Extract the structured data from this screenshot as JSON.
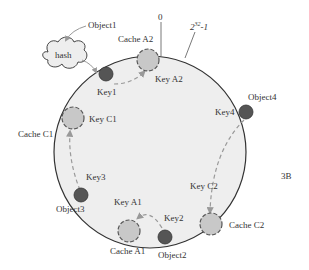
{
  "diagram": {
    "type": "consistent-hashing-ring",
    "figure_label": "3B",
    "colors": {
      "ring_fill": "#eeeeee",
      "ring_stroke": "#333333",
      "cache_fill": "#c8c8c8",
      "cache_stroke": "#555555",
      "key_fill": "#555555",
      "arrow": "#999999"
    },
    "ring_labels": {
      "start": "0",
      "end_base": "2",
      "end_exp": "32",
      "end_suffix": "-1"
    },
    "hash": {
      "label": "hash",
      "input": "Object1"
    },
    "objects": [
      {
        "id": "object1",
        "label": "Object1",
        "key_label": "Key1"
      },
      {
        "id": "object2",
        "label": "Object2",
        "key_label": "Key2"
      },
      {
        "id": "object3",
        "label": "Object3",
        "key_label": "Key3"
      },
      {
        "id": "object4",
        "label": "Object4",
        "key_label": "Key4"
      }
    ],
    "caches": [
      {
        "id": "cache-a1",
        "label": "Cache A1",
        "key_label": "Key  A1"
      },
      {
        "id": "cache-a2",
        "label": "Cache A2",
        "key_label": "Key  A2"
      },
      {
        "id": "cache-c1",
        "label": "Cache C1",
        "key_label": "Key  C1"
      },
      {
        "id": "cache-c2",
        "label": "Cache C2",
        "key_label": "Key  C2"
      }
    ]
  }
}
